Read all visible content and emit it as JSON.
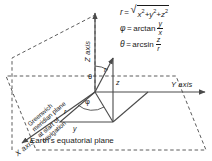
{
  "figure": {
    "caption": "Earth's equatorial plane",
    "plane_label": "Greenwich\nmeridian plane\nat start of\nnavigation",
    "plane_label_lines": [
      "Greenwich",
      "meridian plane",
      "at start of",
      "navigation"
    ]
  },
  "axes": {
    "z": "Z axis",
    "y": "Y axis",
    "x": "X axis"
  },
  "vectors": {
    "r_main": "r",
    "r_proj": "r",
    "z_component": "z",
    "y_component": "y"
  },
  "angles": {
    "theta": "θ",
    "phi": "φ"
  },
  "equations": [
    {
      "lhs": "r",
      "rel": "=",
      "kind": "radical",
      "body": "x² + y² + z²",
      "text": "r = √(x² + y² + z²)"
    },
    {
      "lhs": "φ",
      "rel": "=",
      "kind": "fraction",
      "fn": "arctan",
      "num": "y",
      "den": "x",
      "text": "φ = arctan y/x"
    },
    {
      "lhs": "θ",
      "rel": "=",
      "kind": "fraction",
      "fn": "arcsin",
      "num": "z",
      "den": "r",
      "text": "θ = arcsin z/r"
    }
  ],
  "colors": {
    "ink": "#1a1a1a",
    "line": "#4a4a4a",
    "background": "#ffffff"
  }
}
